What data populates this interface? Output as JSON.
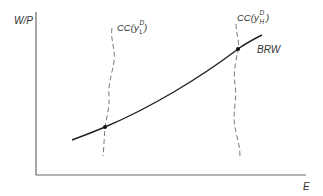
{
  "diagram": {
    "y_axis_label": "W/P",
    "x_axis_label": "E",
    "curves": [
      {
        "id": "brw",
        "label": "BRW",
        "style": "solid",
        "shape": "increasing, convex"
      },
      {
        "id": "cc_low",
        "label_main": "CC(",
        "label_var": "y",
        "label_sup": "D",
        "label_sub": "L",
        "label_close": ")",
        "style": "dashed",
        "shape": "near-vertical"
      },
      {
        "id": "cc_high",
        "label_main": "CC(",
        "label_var": "y",
        "label_sup": "D",
        "label_sub": "H",
        "label_close": ")",
        "style": "dashed",
        "shape": "near-vertical"
      }
    ],
    "points": [
      {
        "id": "eq_low",
        "description": "intersection of BRW and CC(y^D_L)"
      },
      {
        "id": "eq_high",
        "description": "intersection of BRW and CC(y^D_H)"
      }
    ]
  }
}
